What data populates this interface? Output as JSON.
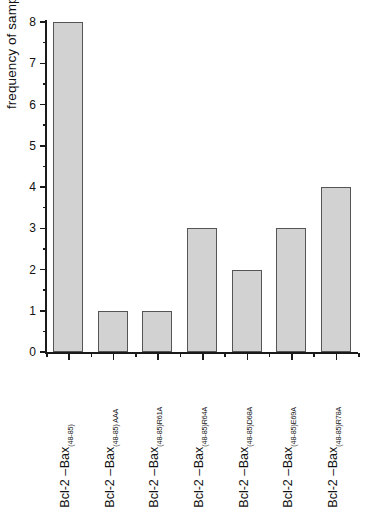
{
  "chart_data": {
    "type": "bar",
    "title": "",
    "xlabel": "",
    "ylabel": "frequency of sampling",
    "ylim": [
      0,
      8
    ],
    "ytick_step": 1,
    "yminor_step": 0.5,
    "grid": false,
    "legend": null,
    "bar_fill_color": "#d2d2d2",
    "bar_border_color": "#555555",
    "axis_color": "#1a1a1a",
    "ytick_labels": [
      "0",
      "1",
      "2",
      "3",
      "4",
      "5",
      "6",
      "7",
      "8"
    ],
    "categories": [
      "Bcl-2 –Bax(48-85)",
      "Bcl-2 –Bax(48-85) AAA",
      "Bcl-2 –Bax(48-85)R61A",
      "Bcl-2 –Bax(48-85)R64A",
      "Bcl-2 –Bax(48-85)D68A",
      "Bcl-2 –Bax(48-85)E69A",
      "Bcl-2 –Bax(48-85)R78A"
    ],
    "values": [
      8,
      1,
      1,
      3,
      2,
      3,
      4
    ]
  },
  "labels": [
    {
      "base": "Bcl-2 ",
      "dash": "–",
      "prot": "Bax",
      "sub": "(48-85)"
    },
    {
      "base": "Bcl-2 ",
      "dash": "–",
      "prot": "Bax",
      "sub": "(48-85) AAA"
    },
    {
      "base": "Bcl-2 ",
      "dash": "–",
      "prot": "Bax",
      "sub": "(48-85)R61A"
    },
    {
      "base": "Bcl-2 ",
      "dash": "–",
      "prot": "Bax",
      "sub": "(48-85)R64A"
    },
    {
      "base": "Bcl-2 ",
      "dash": "–",
      "prot": "Bax",
      "sub": "(48-85)D68A"
    },
    {
      "base": "Bcl-2 ",
      "dash": "–",
      "prot": "Bax",
      "sub": "(48-85)E69A"
    },
    {
      "base": "Bcl-2 ",
      "dash": "–",
      "prot": "Bax",
      "sub": "(48-85)R78A"
    }
  ],
  "yticks": [
    {
      "label": "8",
      "value": 8
    },
    {
      "label": "7",
      "value": 7
    },
    {
      "label": "6",
      "value": 6
    },
    {
      "label": "5",
      "value": 5
    },
    {
      "label": "4",
      "value": 4
    },
    {
      "label": "3",
      "value": 3
    },
    {
      "label": "2",
      "value": 2
    },
    {
      "label": "1",
      "value": 1
    },
    {
      "label": "0",
      "value": 0
    }
  ]
}
